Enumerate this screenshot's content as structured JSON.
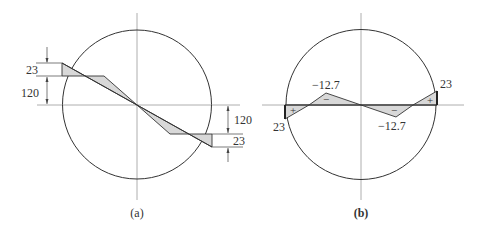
{
  "figure": {
    "panel_a": {
      "caption": "(a)",
      "labels": {
        "top_small": "23",
        "top_large": "120",
        "bottom_large": "120",
        "bottom_small": "23"
      }
    },
    "panel_b": {
      "caption": "(b)",
      "labels": {
        "left_end": "23",
        "left_peak": "−12.7",
        "right_trough": "−12.7",
        "right_end": "23"
      },
      "signs": {
        "left_end_sign": "+",
        "left_peak_sign": "−",
        "right_trough_sign": "−",
        "right_end_sign": "+"
      }
    },
    "colors": {
      "stroke": "#333333",
      "shade": "#d8d8d8",
      "axis": "#9a9a9a"
    }
  }
}
